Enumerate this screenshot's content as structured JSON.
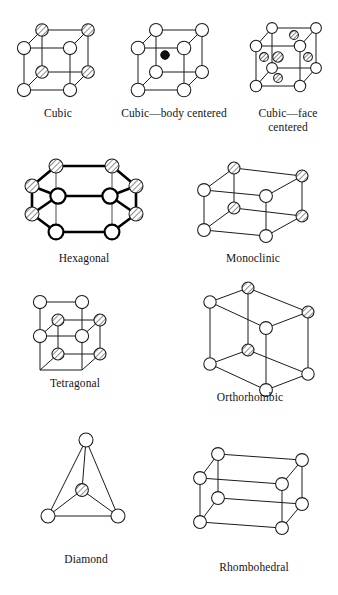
{
  "figure": {
    "background_color": "#ffffff",
    "line_color": "#1b1b1b"
  },
  "structures": [
    {
      "id": "cubic",
      "label": "Cubic",
      "atom_count": 8,
      "description": "Simple cubic unit cell with eight corner atoms"
    },
    {
      "id": "cubic-body-centered",
      "label": "Cubic—body centered",
      "atom_count": 9,
      "description": "Cubic cell with eight corner atoms and one atom at the body center"
    },
    {
      "id": "cubic-face-centered",
      "label": "Cubic—face\ncentered",
      "atom_count": 14,
      "description": "Cubic cell with eight corner atoms and one atom at each of six face centers"
    },
    {
      "id": "hexagonal",
      "label": "Hexagonal",
      "atom_count": 14,
      "description": "Hexagonal prism drawn with heavy strokes"
    },
    {
      "id": "monoclinic",
      "label": "Monoclinic",
      "atom_count": 8,
      "description": "Skewed parallelepiped with eight corner atoms"
    },
    {
      "id": "tetragonal",
      "label": "Tetragonal",
      "atom_count": 8,
      "description": "Rectangular prism with square base and eight corner atoms"
    },
    {
      "id": "orthorhombic",
      "label": "Orthorhombic",
      "atom_count": 8,
      "description": "Tall rectangular prism with eight corner atoms"
    },
    {
      "id": "diamond",
      "label": "Diamond",
      "atom_count": 4,
      "description": "Tetrahedral arrangement with a central hatched atom"
    },
    {
      "id": "rhombohedral",
      "label": "Rhombohedral",
      "atom_count": 8,
      "description": "Strongly skewed parallelepiped with eight corner atoms"
    }
  ]
}
